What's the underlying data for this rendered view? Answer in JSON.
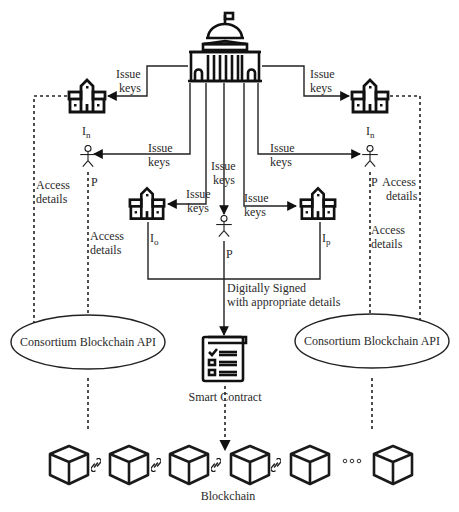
{
  "diagram": {
    "central_authority": {
      "icon": "government-building-icon"
    },
    "issue_keys_label_line1": "Issue",
    "issue_keys_label_line2": "keys",
    "institutions": {
      "left_top": {
        "label": "I",
        "subscript": "n",
        "icon": "institution-building-icon"
      },
      "right_top": {
        "label": "I",
        "subscript": "n",
        "icon": "institution-building-icon"
      },
      "left_mid": {
        "label": "I",
        "subscript": "o",
        "icon": "institution-building-icon"
      },
      "right_mid": {
        "label": "I",
        "subscript": "p",
        "icon": "institution-building-icon"
      }
    },
    "persons": {
      "left": {
        "label": "P",
        "icon": "person-icon"
      },
      "right": {
        "label": "P",
        "icon": "person-icon"
      },
      "center": {
        "label": "P",
        "icon": "person-icon"
      }
    },
    "access_details_line1": "Access",
    "access_details_line2": "details",
    "signed_line1": "Digitally Signed",
    "signed_line2": "with appropriate details",
    "api_left": "Consortium Blockchain API",
    "api_right": "Consortium Blockchain API",
    "smart_contract": {
      "label": "Smart Contract",
      "icon": "checklist-document-icon"
    },
    "blockchain": {
      "label": "Blockchain",
      "blocks": 6,
      "ellipsis": "•••"
    }
  }
}
